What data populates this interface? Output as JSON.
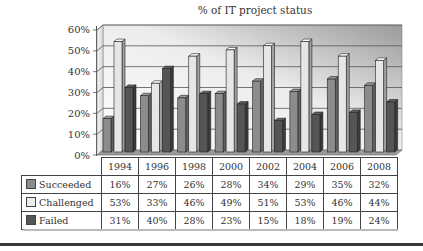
{
  "chart_data": {
    "type": "bar",
    "title": "% of IT project status",
    "xlabel": "",
    "ylabel": "",
    "ylim": [
      0,
      60
    ],
    "yticks": [
      "0%",
      "10%",
      "20%",
      "30%",
      "40%",
      "50%",
      "60%"
    ],
    "grid": true,
    "style": "3d-clustered-column with data table",
    "categories": [
      "1994",
      "1996",
      "1998",
      "2000",
      "2002",
      "2004",
      "2006",
      "2008"
    ],
    "series": [
      {
        "name": "Succeeded",
        "values": [
          16,
          27,
          26,
          28,
          34,
          29,
          35,
          32
        ],
        "color": "#8c8c8c"
      },
      {
        "name": "Challenged",
        "values": [
          53,
          33,
          46,
          49,
          51,
          53,
          46,
          44
        ],
        "color": "#e6e6e6"
      },
      {
        "name": "Failed",
        "values": [
          31,
          40,
          28,
          23,
          15,
          18,
          19,
          24
        ],
        "color": "#555555"
      }
    ],
    "legend_position": "data-table-left"
  },
  "table": {
    "years": [
      "1994",
      "1996",
      "1998",
      "2000",
      "2002",
      "2004",
      "2006",
      "2008"
    ],
    "rows": [
      {
        "label": "Succeeded",
        "cells": [
          "16%",
          "27%",
          "26%",
          "28%",
          "34%",
          "29%",
          "35%",
          "32%"
        ]
      },
      {
        "label": "Challenged",
        "cells": [
          "53%",
          "33%",
          "46%",
          "49%",
          "51%",
          "53%",
          "46%",
          "44%"
        ]
      },
      {
        "label": "Failed",
        "cells": [
          "31%",
          "40%",
          "28%",
          "23%",
          "15%",
          "18%",
          "19%",
          "24%"
        ]
      }
    ]
  }
}
